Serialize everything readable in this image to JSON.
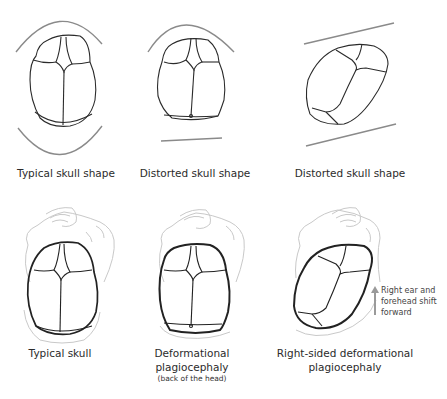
{
  "figure": {
    "top_row": [
      {
        "id": "typical-shape",
        "label": "Typical skull shape"
      },
      {
        "id": "distorted-shape-1",
        "label": "Distorted skull shape"
      },
      {
        "id": "distorted-shape-2",
        "label": "Distorted skull shape"
      }
    ],
    "bottom_row": [
      {
        "id": "typical-skull",
        "label": "Typical skull",
        "sublabel": ""
      },
      {
        "id": "deformational-plagiocephaly",
        "label_line1": "Deformational",
        "label_line2": "plagiocephaly",
        "sublabel": "(back of the head)"
      },
      {
        "id": "right-sided-plagiocephaly",
        "label_line1": "Right-sided deformational",
        "label_line2": "plagiocephaly"
      }
    ],
    "annotation": {
      "line1": "Right ear and",
      "line2": "forehead shift",
      "line3": "forward",
      "arrow": "up-arrow"
    },
    "colors": {
      "outline": "#2b2b2b",
      "guide": "#8a8a8a",
      "body": "#c9c9c9",
      "arrow": "#9a9a9a"
    }
  }
}
